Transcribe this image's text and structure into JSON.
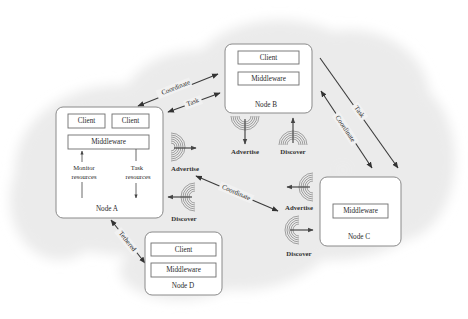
{
  "diagram": {
    "type": "network-architecture",
    "background": {
      "cloud_color": "#ececec"
    },
    "nodes": [
      {
        "id": "node-a",
        "label": "Node A",
        "components": [
          {
            "label": "Client"
          },
          {
            "label": "Client"
          },
          {
            "label": "Middleware"
          }
        ],
        "internal_flows": [
          {
            "label_line1": "Monitor",
            "label_line2": "resources",
            "direction": "up"
          },
          {
            "label_line1": "Task",
            "label_line2": "resources",
            "direction": "down"
          }
        ]
      },
      {
        "id": "node-b",
        "label": "Node B",
        "components": [
          {
            "label": "Client"
          },
          {
            "label": "Middleware"
          }
        ]
      },
      {
        "id": "node-c",
        "label": "Node C",
        "components": [
          {
            "label": "Middleware"
          }
        ]
      },
      {
        "id": "node-d",
        "label": "Node D",
        "components": [
          {
            "label": "Client"
          },
          {
            "label": "Middleware"
          }
        ]
      }
    ],
    "signals": {
      "node_a": {
        "advertise": "Advertise",
        "discover": "Discover"
      },
      "node_b": {
        "advertise": "Advertise",
        "discover": "Discover"
      },
      "node_c": {
        "advertise": "Advertise",
        "discover": "Discover"
      }
    },
    "edges": [
      {
        "from": "Node A",
        "to": "Node B",
        "label": "Coordinate",
        "bidirectional": true
      },
      {
        "from": "Node A",
        "to": "Node B",
        "label": "Task",
        "bidirectional": true
      },
      {
        "from": "Node B",
        "to": "Node C",
        "label": "Task",
        "bidirectional": false
      },
      {
        "from": "Node B",
        "to": "Node C",
        "label": "Coordinate",
        "bidirectional": true
      },
      {
        "from": "Node A",
        "to": "Node C",
        "label": "Coordinate",
        "bidirectional": true
      },
      {
        "from": "Node A",
        "to": "Node D",
        "label": "Tethered",
        "bidirectional": true
      }
    ]
  }
}
